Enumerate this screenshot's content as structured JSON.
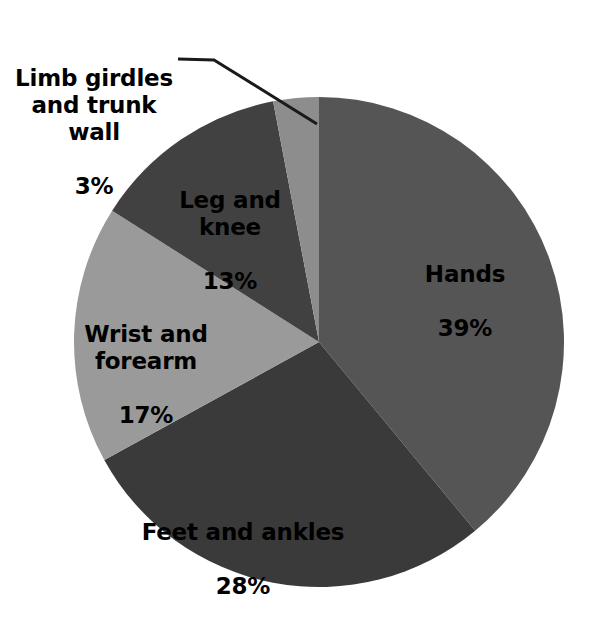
{
  "chart_data": {
    "type": "pie",
    "title": "",
    "subtitle": "",
    "xlabel": "",
    "ylabel": "",
    "legend_position": "none",
    "grid": false,
    "units": "%",
    "start_angle_deg": 0,
    "direction": "clockwise",
    "categories": [
      "Hands",
      "Feet and ankles",
      "Wrist and forearm",
      "Leg and knee",
      "Limb girdles and trunk wall"
    ],
    "values": [
      39,
      28,
      17,
      13,
      3
    ],
    "colors": [
      "#555555",
      "#3a3a3a",
      "#9a9a9a",
      "#414141",
      "#8d8d8d"
    ],
    "slices": [
      {
        "name": "Hands",
        "value": 39,
        "value_label": "39%",
        "color": "#555555",
        "label_placement": "inside"
      },
      {
        "name": "Feet and ankles",
        "value": 28,
        "value_label": "28%",
        "color": "#3a3a3a",
        "label_placement": "inside"
      },
      {
        "name": "Wrist and forearm",
        "value": 17,
        "value_label": "17%",
        "color": "#9a9a9a",
        "label_placement": "inside"
      },
      {
        "name": "Leg and knee",
        "value": 13,
        "value_label": "13%",
        "color": "#414141",
        "label_placement": "inside"
      },
      {
        "name": "Limb girdles and trunk wall",
        "value": 3,
        "value_label": "3%",
        "color": "#8d8d8d",
        "label_placement": "outside-leader"
      }
    ]
  },
  "labels": {
    "limb": {
      "name": "Limb girdles\nand trunk\nwall",
      "value": "3%"
    },
    "leg": {
      "name": "Leg and\nknee",
      "value": "13%"
    },
    "wrist": {
      "name": "Wrist and\nforearm",
      "value": "17%"
    },
    "feet": {
      "name": "Feet and ankles",
      "value": "28%"
    },
    "hands": {
      "name": "Hands",
      "value": "39%"
    }
  },
  "style": {
    "background": "#ffffff",
    "text_color": "#000000",
    "leader_line_color": "#1a1a1a"
  }
}
